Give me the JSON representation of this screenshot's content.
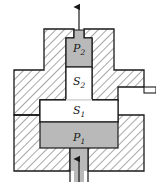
{
  "figure": {
    "kind": "cross-section-diagram",
    "title": "",
    "background_color": "#ffffff",
    "outline_color": "#1a1a1a",
    "hatch_color": "#7a7a7a",
    "chamber_fill_color": "#b9b9b9",
    "void_fill_color": "#ffffff",
    "arrow_color": "#1a1a1a"
  },
  "labels": {
    "p2": {
      "base": "P",
      "sub": "2"
    },
    "s2": {
      "base": "S",
      "sub": "2"
    },
    "s1": {
      "base": "S",
      "sub": "1"
    },
    "p1": {
      "base": "P",
      "sub": "1"
    }
  },
  "arrows": [
    {
      "name": "outlet-arrow-top",
      "direction": "up",
      "x": 79,
      "y_tail": 30,
      "y_head": 6
    },
    {
      "name": "inlet-arrow-bottom",
      "direction": "up",
      "x": 79,
      "y_tail": 181,
      "y_head": 158
    }
  ],
  "regions": [
    {
      "name": "chamber-p2",
      "fill": "chamber",
      "label": "p2"
    },
    {
      "name": "void-s2",
      "fill": "void",
      "label": "s2"
    },
    {
      "name": "void-s1",
      "fill": "void",
      "label": "s1"
    },
    {
      "name": "chamber-p1",
      "fill": "chamber",
      "label": "p1"
    },
    {
      "name": "void-left-shoulder",
      "fill": "void",
      "label": null
    },
    {
      "name": "void-right-shoulder",
      "fill": "void",
      "label": null
    },
    {
      "name": "side-port-right",
      "fill": "void",
      "label": null
    }
  ]
}
